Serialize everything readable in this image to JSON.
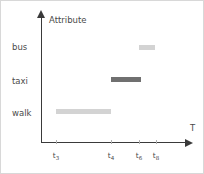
{
  "chart_data": {
    "type": "bar",
    "title": "",
    "subtitle": "",
    "xlabel": "T",
    "ylabel": "Attribute",
    "orientation": "horizontal-timeline",
    "grid": false,
    "legend": "none",
    "categories": [
      "walk",
      "taxi",
      "bus"
    ],
    "x_tick_labels": [
      "t3",
      "t4",
      "t6",
      "t8"
    ],
    "x_tick_subscripts": [
      "3",
      "4",
      "6",
      "8"
    ],
    "x_tick_base": "t",
    "x_tick_positions_px": [
      55,
      110,
      138,
      155
    ],
    "y_category_positions_px": [
      111,
      79,
      45
    ],
    "segments": [
      {
        "category": "walk",
        "start_label": "t3",
        "end_label": "t4",
        "start_px": 55,
        "end_px": 110,
        "y_px": 108,
        "color": "#d3d3d3"
      },
      {
        "category": "taxi",
        "start_label": "t4",
        "end_label": "t6",
        "start_px": 110,
        "end_px": 140,
        "y_px": 76,
        "color": "#707070"
      },
      {
        "category": "bus",
        "start_label": "t6",
        "end_label": "t8",
        "start_px": 138,
        "end_px": 154,
        "y_px": 44,
        "color": "#d3d3d3"
      }
    ],
    "colors": {
      "axis": "#3a3a3a",
      "text": "#4a4a4a",
      "tick": "#b0b0b0",
      "light_segment": "#d3d3d3",
      "dark_segment": "#707070",
      "background": "#ffffff",
      "border": "#d8d8d8"
    }
  },
  "axes": {
    "y_title": "Attribute",
    "x_title": "T"
  },
  "category_labels": {
    "bus": "bus",
    "taxi": "taxi",
    "walk": "walk"
  },
  "ticks": [
    {
      "base": "t",
      "sub": "3"
    },
    {
      "base": "t",
      "sub": "4"
    },
    {
      "base": "t",
      "sub": "6"
    },
    {
      "base": "t",
      "sub": "8"
    }
  ]
}
